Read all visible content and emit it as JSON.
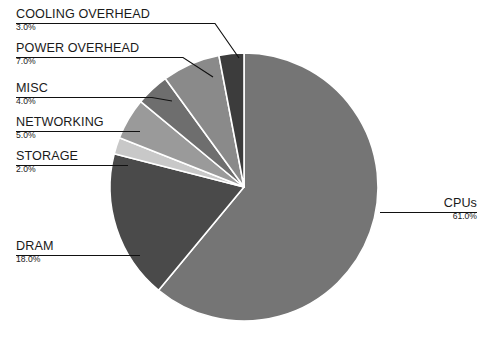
{
  "chart_data": {
    "type": "pie",
    "title": "",
    "subtitle": "",
    "xlabel": "",
    "ylabel": "",
    "legend_position": "callout-labels",
    "grid": false,
    "units": "percent",
    "start_angle_deg": -90,
    "direction": "clockwise",
    "categories": [
      "CPUs",
      "DRAM",
      "STORAGE",
      "NETWORKING",
      "MISC",
      "POWER OVERHEAD",
      "COOLING OVERHEAD"
    ],
    "values": [
      61.0,
      18.0,
      2.0,
      5.0,
      4.0,
      7.0,
      3.0
    ],
    "value_labels": [
      "61.0%",
      "18.0%",
      "2.0%",
      "5.0%",
      "4.0%",
      "7.0%",
      "3.0%"
    ],
    "colors": [
      "#757575",
      "#4a4a4a",
      "#c8c8c8",
      "#9a9a9a",
      "#6e6e6e",
      "#8a8a8a",
      "#3c3c3c"
    ],
    "slice_separator_color": "#ffffff",
    "slices": [
      {
        "label": "CPUs",
        "value": 61.0,
        "value_label": "61.0%",
        "color": "#757575"
      },
      {
        "label": "DRAM",
        "value": 18.0,
        "value_label": "18.0%",
        "color": "#4a4a4a"
      },
      {
        "label": "STORAGE",
        "value": 2.0,
        "value_label": "2.0%",
        "color": "#c8c8c8"
      },
      {
        "label": "NETWORKING",
        "value": 5.0,
        "value_label": "5.0%",
        "color": "#9a9a9a"
      },
      {
        "label": "MISC",
        "value": 4.0,
        "value_label": "4.0%",
        "color": "#6e6e6e"
      },
      {
        "label": "POWER OVERHEAD",
        "value": 7.0,
        "value_label": "7.0%",
        "color": "#8a8a8a"
      },
      {
        "label": "COOLING OVERHEAD",
        "value": 3.0,
        "value_label": "3.0%",
        "color": "#3c3c3c"
      }
    ]
  },
  "callouts": {
    "cooling_overhead": {
      "name": "COOLING OVERHEAD",
      "value": "3.0%"
    },
    "power_overhead": {
      "name": "POWER OVERHEAD",
      "value": "7.0%"
    },
    "misc": {
      "name": "MISC",
      "value": "4.0%"
    },
    "networking": {
      "name": "NETWORKING",
      "value": "5.0%"
    },
    "storage": {
      "name": "STORAGE",
      "value": "2.0%"
    },
    "dram": {
      "name": "DRAM",
      "value": "18.0%"
    },
    "cpus": {
      "name": "CPUs",
      "value": "61.0%"
    }
  }
}
